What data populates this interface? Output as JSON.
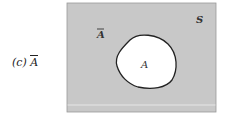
{
  "diagram": {
    "type": "venn",
    "caption_prefix": "(c)",
    "caption_set": "A",
    "caption_complement": true,
    "universe_label": "S",
    "complement_label": "A",
    "set_label": "A",
    "colors": {
      "shaded": "#c8c8c8",
      "unshaded": "#ffffff",
      "outline": "#222222"
    }
  }
}
